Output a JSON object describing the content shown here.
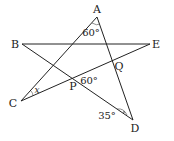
{
  "diagram": {
    "type": "geometry-star",
    "points": {
      "A": {
        "label": "A",
        "x": 97,
        "y": 17,
        "lx": 97,
        "ly": 13
      },
      "B": {
        "label": "B",
        "x": 22,
        "y": 44,
        "lx": 15,
        "ly": 48
      },
      "E": {
        "label": "E",
        "x": 150,
        "y": 44,
        "lx": 156,
        "ly": 48
      },
      "C": {
        "label": "C",
        "x": 21,
        "y": 101,
        "lx": 13,
        "ly": 107
      },
      "D": {
        "label": "D",
        "x": 133,
        "y": 120,
        "lx": 135,
        "ly": 132
      },
      "P": {
        "label": "P",
        "lx": 73,
        "ly": 90
      },
      "Q": {
        "label": "Q",
        "lx": 119,
        "ly": 70
      }
    },
    "segments": [
      {
        "from": "A",
        "to": "C"
      },
      {
        "from": "A",
        "to": "D"
      },
      {
        "from": "B",
        "to": "E"
      },
      {
        "from": "B",
        "to": "D"
      },
      {
        "from": "C",
        "to": "E"
      }
    ],
    "angles": [
      {
        "label": "60°",
        "at": "A",
        "lx": 91,
        "ly": 36
      },
      {
        "label": "60°",
        "at": "P",
        "lx": 89,
        "ly": 84
      },
      {
        "label": "35°",
        "at": "D",
        "lx": 107,
        "ly": 119
      },
      {
        "label": "x",
        "at": "C",
        "lx": 37,
        "ly": 93
      }
    ],
    "line_color": "#222222"
  }
}
